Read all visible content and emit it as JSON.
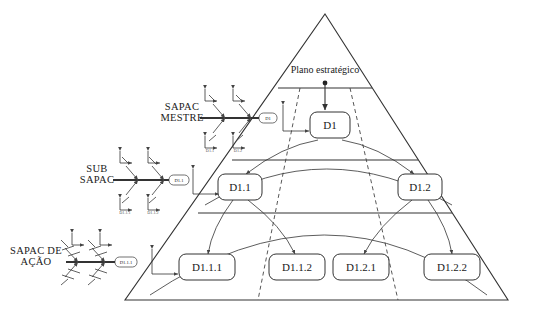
{
  "diagram": {
    "type": "pyramid-hierarchy-with-fishbone",
    "apex_label": "Plano estratégico",
    "pyramid": {
      "apex": {
        "x": 325,
        "y": 14
      },
      "base_left": {
        "x": 125,
        "y": 300
      },
      "base_right": {
        "x": 508,
        "y": 300
      },
      "tier_dividers_y": [
        88,
        160,
        213
      ]
    },
    "tiers": [
      {
        "level": 1,
        "side_label": "",
        "nodes": [
          "D1"
        ]
      },
      {
        "level": 2,
        "side_label": "",
        "nodes": [
          "D1.1",
          "D1.2"
        ]
      },
      {
        "level": 3,
        "side_label": "",
        "nodes": [
          "D1.1.1",
          "D1.1.2",
          "D1.2.1",
          "D1.2.2"
        ]
      }
    ],
    "nodes": [
      {
        "id": "D1",
        "label": "D1",
        "x": 330,
        "y": 125,
        "w": 40,
        "h": 26
      },
      {
        "id": "D1.1",
        "label": "D1.1",
        "x": 240,
        "y": 187,
        "w": 44,
        "h": 26
      },
      {
        "id": "D1.2",
        "label": "D1.2",
        "x": 420,
        "y": 187,
        "w": 44,
        "h": 26
      },
      {
        "id": "D1.1.1",
        "label": "D1.1.1",
        "x": 207,
        "y": 267,
        "w": 56,
        "h": 26
      },
      {
        "id": "D1.1.2",
        "label": "D1.1.2",
        "x": 297,
        "y": 267,
        "w": 56,
        "h": 26
      },
      {
        "id": "D1.2.1",
        "label": "D1.2.1",
        "x": 361,
        "y": 267,
        "w": 56,
        "h": 26
      },
      {
        "id": "D1.2.2",
        "label": "D1.2.2",
        "x": 452,
        "y": 267,
        "w": 56,
        "h": 26
      }
    ],
    "edges": [
      {
        "from": "Plano estratégico",
        "to": "D1"
      },
      {
        "from": "D1",
        "to": "D1.1"
      },
      {
        "from": "D1",
        "to": "D1.2"
      },
      {
        "from": "D1.1",
        "to": "D1.1.1"
      },
      {
        "from": "D1.1",
        "to": "D1.1.2"
      },
      {
        "from": "D1.2",
        "to": "D1.2.1"
      },
      {
        "from": "D1.2",
        "to": "D1.2.2"
      }
    ],
    "fishbones": [
      {
        "id": "sapac-mestre",
        "title": "SAPAC MESTRE",
        "title_line1": "SAPAC",
        "title_line2": "MESTRE",
        "head_label": "D1",
        "bone_labels": [
          "D1.1",
          "D1.2"
        ],
        "spine": {
          "x1": 200,
          "y1": 118,
          "x2": 262,
          "y2": 118
        },
        "title_pos": {
          "x": 180,
          "y": 113
        },
        "head_pos": {
          "x": 268,
          "y": 118,
          "w": 18,
          "h": 10
        }
      },
      {
        "id": "sub-sapac",
        "title": "SUB SAPAC",
        "title_line1": "SUB",
        "title_line2": "SAPAC",
        "head_label": "D1.1",
        "bone_labels": [
          "D1.1.1",
          "D1.1.2"
        ],
        "spine": {
          "x1": 113,
          "y1": 180,
          "x2": 165,
          "y2": 180
        },
        "title_pos": {
          "x": 96,
          "y": 175
        },
        "head_pos": {
          "x": 173,
          "y": 180,
          "w": 20,
          "h": 10
        }
      },
      {
        "id": "sapac-de-acao",
        "title": "SAPAC DE AÇÃO",
        "title_line1": "SAPAC DE",
        "title_line2": "AÇÃO",
        "head_label": "D1.1.1",
        "bone_labels": [],
        "spine": {
          "x1": 66,
          "y1": 262,
          "x2": 110,
          "y2": 262
        },
        "title_pos": {
          "x": 36,
          "y": 257
        },
        "head_pos": {
          "x": 120,
          "y": 262,
          "w": 22,
          "h": 10
        }
      }
    ],
    "axis_markers": [
      {
        "id": "axis-mestre-a",
        "x": 205,
        "y": 92
      },
      {
        "id": "axis-mestre-b",
        "x": 233,
        "y": 92
      },
      {
        "id": "axis-mestre-c",
        "x": 205,
        "y": 140
      },
      {
        "id": "axis-mestre-d",
        "x": 233,
        "y": 140
      },
      {
        "id": "axis-sub-a",
        "x": 120,
        "y": 152
      },
      {
        "id": "axis-sub-b",
        "x": 148,
        "y": 152
      },
      {
        "id": "axis-sub-c",
        "x": 120,
        "y": 200
      },
      {
        "id": "axis-sub-d",
        "x": 148,
        "y": 200
      },
      {
        "id": "axis-acao-a",
        "x": 72,
        "y": 234
      },
      {
        "id": "axis-acao-b",
        "x": 100,
        "y": 234
      },
      {
        "id": "axis-pyramid-1",
        "x": 283,
        "y": 108
      },
      {
        "id": "axis-pyramid-2",
        "x": 193,
        "y": 172
      },
      {
        "id": "axis-pyramid-3",
        "x": 152,
        "y": 252
      }
    ],
    "colors": {
      "line": "#333333",
      "dashed": "#444444",
      "text": "#1a1a1a",
      "tiny_text": "#555555",
      "background": "#ffffff"
    }
  }
}
